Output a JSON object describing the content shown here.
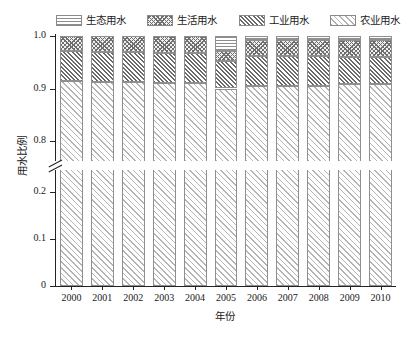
{
  "chart_data": {
    "type": "bar",
    "subtype": "stacked-bar-100-percent",
    "title": "",
    "xlabel": "年份",
    "ylabel": "用水比例",
    "categories": [
      "2000",
      "2001",
      "2002",
      "2003",
      "2004",
      "2005",
      "2006",
      "2007",
      "2008",
      "2009",
      "2010"
    ],
    "series": [
      {
        "name": "生态用水",
        "pattern": "horizontal-lines",
        "values": [
          0.0,
          0.0,
          0.0,
          0.0,
          0.0,
          0.029,
          0.007,
          0.007,
          0.007,
          0.007,
          0.007
        ]
      },
      {
        "name": "生活用水",
        "pattern": "checker-dots",
        "values": [
          0.029,
          0.031,
          0.031,
          0.033,
          0.033,
          0.019,
          0.031,
          0.031,
          0.031,
          0.033,
          0.033
        ]
      },
      {
        "name": "工业用水",
        "pattern": "dense-diagonal-hatch",
        "values": [
          0.056,
          0.057,
          0.057,
          0.057,
          0.057,
          0.052,
          0.057,
          0.057,
          0.057,
          0.052,
          0.052
        ]
      },
      {
        "name": "农业用水",
        "pattern": "light-diagonal-hatch",
        "values": [
          0.915,
          0.912,
          0.912,
          0.91,
          0.91,
          0.9,
          0.905,
          0.905,
          0.905,
          0.908,
          0.908
        ]
      }
    ],
    "stack_order_top_to_bottom": [
      "生态用水",
      "生活用水",
      "工业用水",
      "农业用水"
    ],
    "ylim": [
      0,
      1.0
    ],
    "y_axis_broken": true,
    "y_break_range": [
      0.25,
      0.75
    ],
    "y_ticks_lower": [
      "0",
      "0.1",
      "0.2"
    ],
    "y_ticks_upper": [
      "0.8",
      "0.9",
      "1.0"
    ],
    "y_tick_values_lower": [
      0,
      0.1,
      0.2
    ],
    "y_tick_values_upper": [
      0.8,
      0.9,
      1.0
    ],
    "grid": false,
    "legend_position": "top",
    "legend_entries": [
      "生态用水",
      "生活用水",
      "工业用水",
      "农业用水"
    ]
  },
  "legend": {
    "items": [
      {
        "label": "生态用水",
        "swatch": "eco-pattern-swatch"
      },
      {
        "label": "生活用水",
        "swatch": "dom-pattern-swatch"
      },
      {
        "label": "工业用水",
        "swatch": "ind-pattern-swatch"
      },
      {
        "label": "农业用水",
        "swatch": "agr-pattern-swatch"
      }
    ]
  },
  "axes": {
    "y_title": "用水比例",
    "x_title": "年份",
    "y_tick_labels": [
      "1.0",
      "0.9",
      "0.8",
      "0.2",
      "0.1",
      "0"
    ],
    "x_tick_labels": [
      "2000",
      "2001",
      "2002",
      "2003",
      "2004",
      "2005",
      "2006",
      "2007",
      "2008",
      "2009",
      "2010"
    ]
  },
  "colors": {
    "axis": "#222222",
    "pattern_dark": "#6a6a6a",
    "pattern_mid": "#8d8d8d",
    "pattern_light": "#b4b4b4",
    "background": "#ffffff"
  }
}
